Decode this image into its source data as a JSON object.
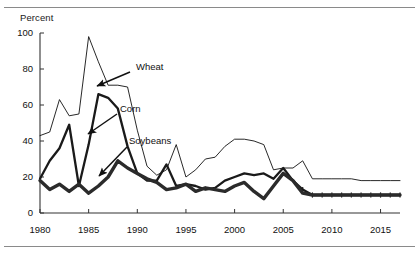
{
  "figure": {
    "y_axis_title": "Percent",
    "has_top_rule": true,
    "has_bottom_rule": true
  },
  "chart_data": {
    "type": "line",
    "title": "",
    "subtitle": "",
    "xlabel": "",
    "ylabel": "Percent",
    "xlim": [
      1980,
      2017
    ],
    "ylim": [
      0,
      100
    ],
    "grid": false,
    "legend_position": "inline-annotations",
    "ytick_labels": [
      "0",
      "20",
      "40",
      "60",
      "80",
      "100"
    ],
    "ytick_values": [
      0,
      20,
      40,
      60,
      80,
      100
    ],
    "xtick_labels": [
      "1980",
      "1985",
      "1990",
      "1995",
      "2000",
      "2005",
      "2010",
      "2015"
    ],
    "xtick_values": [
      1980,
      1985,
      1990,
      1995,
      2000,
      2005,
      2010,
      2015
    ],
    "x": [
      1980,
      1981,
      1982,
      1983,
      1984,
      1985,
      1986,
      1987,
      1988,
      1989,
      1990,
      1991,
      1992,
      1993,
      1994,
      1995,
      1996,
      1997,
      1998,
      1999,
      2000,
      2001,
      2002,
      2003,
      2004,
      2005,
      2006,
      2007,
      2008,
      2009,
      2010,
      2011,
      2012,
      2013,
      2014,
      2015,
      2016,
      2017
    ],
    "series": [
      {
        "name": "Wheat",
        "style": "thin",
        "color": "#111111",
        "values": [
          43,
          45,
          63,
          54,
          55,
          98,
          84,
          71,
          71,
          70,
          46,
          26,
          21,
          24,
          38,
          20,
          24,
          30,
          31,
          37,
          41,
          41,
          40,
          38,
          24,
          25,
          25,
          29,
          19,
          19,
          19,
          19,
          19,
          18,
          18,
          18,
          18,
          18
        ]
      },
      {
        "name": "Corn",
        "style": "medium",
        "color": "#1a1a1a",
        "values": [
          19,
          29,
          36,
          49,
          15,
          38,
          66,
          64,
          58,
          37,
          22,
          18,
          18,
          27,
          15,
          16,
          15,
          13,
          14,
          18,
          20,
          22,
          21,
          22,
          19,
          25,
          18,
          13,
          10,
          10,
          10,
          10,
          10,
          10,
          10,
          10,
          10,
          10
        ]
      },
      {
        "name": "Soybeans",
        "style": "thick",
        "color": "#2b2b2b",
        "values": [
          18,
          13,
          16,
          12,
          16,
          11,
          15,
          20,
          29,
          25,
          22,
          19,
          17,
          13,
          14,
          16,
          12,
          14,
          13,
          12,
          15,
          17,
          12,
          8,
          15,
          22,
          18,
          11,
          10,
          10,
          10,
          10,
          10,
          10,
          10,
          10,
          10,
          10
        ]
      }
    ],
    "annotations": [
      {
        "label": "Wheat",
        "text_x": 136,
        "text_y": 70,
        "arrow_from_x": 130,
        "arrow_from_y": 72,
        "arrow_to_x": 97,
        "arrow_to_y": 86
      },
      {
        "label": "Corn",
        "text_x": 120,
        "text_y": 112,
        "arrow_from_x": 117,
        "arrow_from_y": 114,
        "arrow_to_x": 88,
        "arrow_to_y": 134
      },
      {
        "label": "Soybeans",
        "text_x": 129,
        "text_y": 144,
        "arrow_from_x": 127,
        "arrow_from_y": 147,
        "arrow_to_x": 99,
        "arrow_to_y": 176
      }
    ]
  }
}
